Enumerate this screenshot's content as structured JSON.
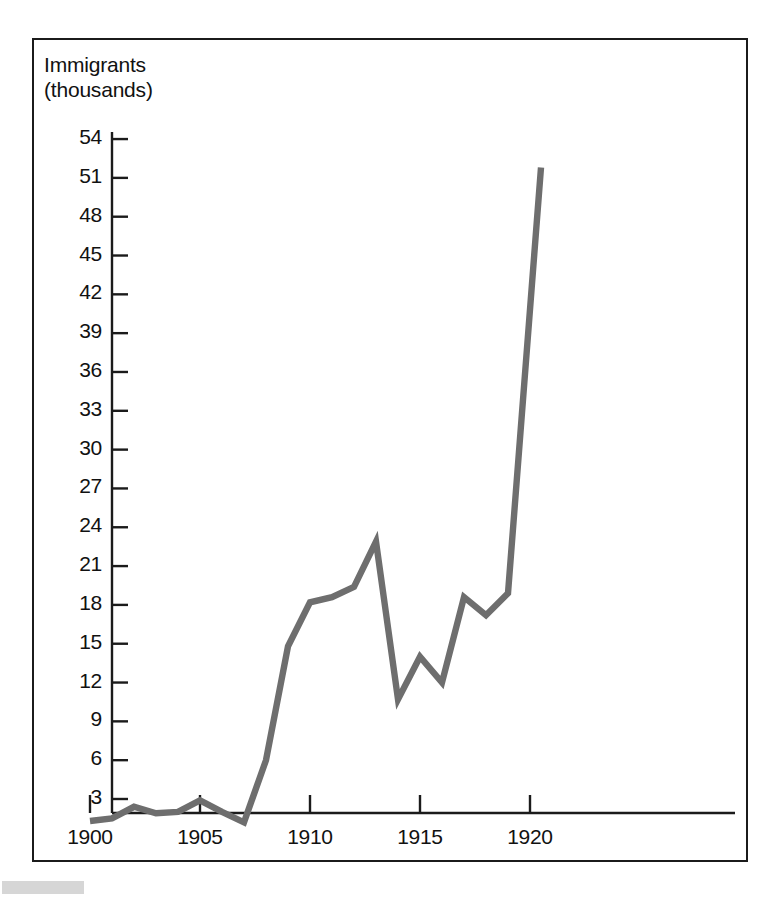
{
  "figure": {
    "axis_title": "Immigrants\n(thousands)",
    "line_color": "#6e6e6e",
    "axis_color": "#1b1b1b",
    "border_color": "#1b1b1b"
  },
  "chart_data": {
    "type": "line",
    "title": "Immigrants (thousands)",
    "xlabel": "",
    "ylabel": "Immigrants (thousands)",
    "x": [
      1900,
      1901,
      1902,
      1903,
      1904,
      1905,
      1906,
      1907,
      1908,
      1909,
      1910,
      1911,
      1912,
      1913,
      1914,
      1915,
      1916,
      1917,
      1918,
      1919,
      1920.5
    ],
    "values": [
      1.3,
      1.5,
      2.4,
      1.9,
      2.0,
      2.9,
      2.0,
      1.2,
      6.0,
      14.8,
      18.2,
      18.6,
      19.4,
      22.9,
      10.7,
      14.0,
      12.0,
      18.6,
      17.2,
      18.9,
      51.8
    ],
    "xtick_labels": [
      "1900",
      "1905",
      "1910",
      "1915",
      "1920"
    ],
    "xticks": [
      1900,
      1905,
      1910,
      1915,
      1920
    ],
    "ytick_labels": [
      "3",
      "6",
      "9",
      "12",
      "15",
      "18",
      "21",
      "24",
      "27",
      "30",
      "33",
      "36",
      "39",
      "42",
      "45",
      "48",
      "51",
      "54"
    ],
    "yticks": [
      3,
      6,
      9,
      12,
      15,
      18,
      21,
      24,
      27,
      30,
      33,
      36,
      39,
      42,
      45,
      48,
      51,
      54
    ],
    "xlim": [
      1899.2,
      1923.0
    ],
    "ylim": [
      0,
      55.5
    ],
    "grid": false,
    "legend": null
  }
}
